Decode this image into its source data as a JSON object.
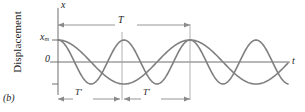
{
  "figure": {
    "panel_label": "(b)",
    "y_axis_title": "Displacement",
    "axis_labels": {
      "vertical": "x",
      "horizontal": "t"
    },
    "tick_labels": {
      "amplitude": "x",
      "amplitude_sub": "m",
      "zero": "0"
    },
    "dimension_labels": {
      "full_period": "T",
      "half_period_left": "T′",
      "half_period_right": "T′"
    },
    "colors": {
      "curve": "#808080",
      "axis": "#6e6e6e",
      "guide": "#9a9a9a",
      "dimension": "#8a8a8a",
      "text": "#1d1d1d",
      "background": "#ffffff"
    }
  },
  "chart_data": {
    "type": "line",
    "title": "",
    "xlabel": "t",
    "ylabel": "Displacement",
    "xlim": [
      0,
      2.1
    ],
    "ylim": [
      -1.15,
      1.15
    ],
    "grid": false,
    "legend": "none",
    "x_unit": "periods of T",
    "annotations": [
      {
        "text": "T",
        "type": "dimension",
        "from": 0.0,
        "to": 1.0,
        "position": "top"
      },
      {
        "text": "T′",
        "type": "dimension",
        "from": 0.0,
        "to": 0.5,
        "position": "bottom"
      },
      {
        "text": "T′",
        "type": "dimension",
        "from": 0.5,
        "to": 1.0,
        "position": "bottom"
      }
    ],
    "reference_lines": {
      "horizontal": [
        {
          "y": 0,
          "label": "0"
        }
      ],
      "vertical": [
        {
          "x": 0.5
        },
        {
          "x": 1.0
        }
      ]
    },
    "y_ticks": [
      {
        "value": 1,
        "label": "x_m"
      },
      {
        "value": 0,
        "label": "0"
      },
      {
        "value": -1,
        "label": ""
      }
    ],
    "series": [
      {
        "name": "wave-period-T",
        "form": "x_m cos(2π t / T)",
        "amplitude": 1,
        "period": 1.0,
        "phase": 0,
        "color": "#808080"
      },
      {
        "name": "wave-period-T-prime",
        "form": "x_m cos(2π t / T′), T′ = T/2",
        "amplitude": 1,
        "period": 0.5,
        "phase": 0,
        "color": "#808080"
      }
    ]
  }
}
